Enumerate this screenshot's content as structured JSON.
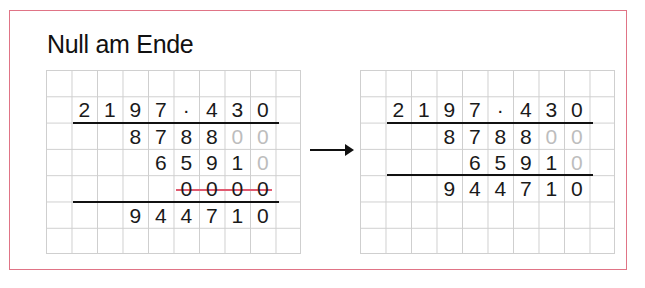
{
  "title": "Null am Ende",
  "colors": {
    "frame": "#e07486",
    "strike": "#e05a70",
    "grey_digit": "#bdbdbd",
    "grid": "#cfcfcf"
  },
  "grid": {
    "columns": 10,
    "rows": 7
  },
  "left": {
    "rows": [
      {
        "row": 2,
        "start_col": 2,
        "digits": [
          "2",
          "1",
          "9",
          "7",
          "·",
          "4",
          "3",
          "0"
        ],
        "grey": []
      },
      {
        "row": 3,
        "start_col": 4,
        "digits": [
          "8",
          "7",
          "8",
          "8",
          "0",
          "0"
        ],
        "grey": [
          4,
          5
        ]
      },
      {
        "row": 4,
        "start_col": 5,
        "digits": [
          "6",
          "5",
          "9",
          "1",
          "0"
        ],
        "grey": [
          4
        ]
      },
      {
        "row": 5,
        "start_col": 6,
        "digits": [
          "0",
          "0",
          "0",
          "0"
        ],
        "grey": [],
        "struck": true
      },
      {
        "row": 6,
        "start_col": 4,
        "digits": [
          "9",
          "4",
          "4",
          "7",
          "1",
          "0"
        ],
        "grey": []
      }
    ]
  },
  "arrow": "→",
  "right": {
    "rows": [
      {
        "row": 2,
        "start_col": 2,
        "digits": [
          "2",
          "1",
          "9",
          "7",
          "·",
          "4",
          "3",
          "0"
        ],
        "grey": []
      },
      {
        "row": 3,
        "start_col": 4,
        "digits": [
          "8",
          "7",
          "8",
          "8",
          "0",
          "0"
        ],
        "grey": [
          4,
          5
        ]
      },
      {
        "row": 4,
        "start_col": 5,
        "digits": [
          "6",
          "5",
          "9",
          "1",
          "0"
        ],
        "grey": [
          4
        ]
      },
      {
        "row": 5,
        "start_col": 4,
        "digits": [
          "9",
          "4",
          "4",
          "7",
          "1",
          "0"
        ],
        "grey": []
      }
    ]
  }
}
